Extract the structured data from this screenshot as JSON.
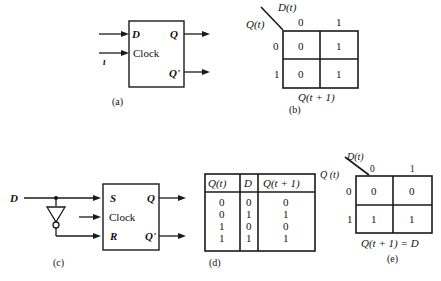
{
  "figure_a": {
    "caption": "(a)",
    "inputs": {
      "d": "D",
      "clock": "Clock"
    },
    "outputs": {
      "q": "Q",
      "q_not": "Q'"
    },
    "stray_mark": "ı"
  },
  "figure_b": {
    "caption": "(b)",
    "col_var": "D(t)",
    "row_var": "Q(t)",
    "col_headers": [
      "0",
      "1"
    ],
    "row_headers": [
      "0",
      "1"
    ],
    "cells": [
      [
        "0",
        "1"
      ],
      [
        "0",
        "1"
      ]
    ],
    "footer": "Q(t + 1)"
  },
  "figure_c": {
    "caption": "(c)",
    "input": "D",
    "inputs": {
      "s": "S",
      "clock": "Clock",
      "r": "R"
    },
    "outputs": {
      "q": "Q",
      "q_not": "Q'"
    }
  },
  "figure_d": {
    "caption": "(d)",
    "headers": [
      "Q(t)",
      "D",
      "Q(t + 1)"
    ],
    "rows": [
      [
        "0",
        "0",
        "0"
      ],
      [
        "0",
        "1",
        "1"
      ],
      [
        "1",
        "0",
        "0"
      ],
      [
        "1",
        "1",
        "1"
      ]
    ]
  },
  "figure_e": {
    "caption": "(e)",
    "col_var": "D(t)",
    "row_var": "Q (t)",
    "col_headers": [
      "0",
      "1"
    ],
    "row_headers": [
      "0",
      "1"
    ],
    "cells": [
      [
        "0",
        "0"
      ],
      [
        "1",
        "1"
      ]
    ],
    "footer": "Q(t + 1) = D"
  }
}
